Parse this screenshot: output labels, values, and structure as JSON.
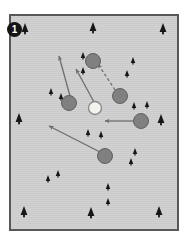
{
  "figure": {
    "panel_label": "1",
    "label_shape": "filled-black-circle",
    "background_color": "#cfcfcf",
    "border_color": "#585858",
    "page_background": "#ffffff",
    "plot": {
      "x": 9,
      "y": 14,
      "width": 170,
      "height": 217
    }
  },
  "legend_colors": {
    "node_fill": "#808080",
    "node_stroke": "#5f5f5f",
    "highlight_node_fill": "#f2f2ee",
    "highlight_node_stroke": "#8a8a8a",
    "path_color": "#6e6e6e",
    "tree_color": "#171717",
    "label_background": "#141414",
    "label_text": "#ffffff"
  },
  "chart_data": {
    "type": "scatter",
    "title": "",
    "subtitle": "",
    "xlabel": "",
    "ylabel": "",
    "grid": false,
    "legend_position": "none",
    "xlim": [
      0,
      166
    ],
    "ylim": [
      0,
      213
    ],
    "annotations": [
      {
        "name": "panel-number",
        "text": "1",
        "x": 15,
        "y": 30
      }
    ],
    "series": [
      {
        "name": "trees",
        "marker": "conifer-tree",
        "points": [
          {
            "x": 14,
            "y": 16,
            "size": 9
          },
          {
            "x": 82,
            "y": 15,
            "size": 9
          },
          {
            "x": 152,
            "y": 16,
            "size": 9
          },
          {
            "x": 72,
            "y": 42,
            "size": 6
          },
          {
            "x": 72,
            "y": 57,
            "size": 6
          },
          {
            "x": 122,
            "y": 47,
            "size": 6
          },
          {
            "x": 116,
            "y": 60,
            "size": 6
          },
          {
            "x": 40,
            "y": 78,
            "size": 6
          },
          {
            "x": 50,
            "y": 83,
            "size": 6
          },
          {
            "x": 123,
            "y": 92,
            "size": 6
          },
          {
            "x": 136,
            "y": 91,
            "size": 6
          },
          {
            "x": 8,
            "y": 106,
            "size": 9
          },
          {
            "x": 150,
            "y": 107,
            "size": 9
          },
          {
            "x": 77,
            "y": 119,
            "size": 6
          },
          {
            "x": 90,
            "y": 121,
            "size": 6
          },
          {
            "x": 124,
            "y": 138,
            "size": 6
          },
          {
            "x": 120,
            "y": 148,
            "size": 6
          },
          {
            "x": 37,
            "y": 165,
            "size": 6
          },
          {
            "x": 47,
            "y": 160,
            "size": 6
          },
          {
            "x": 97,
            "y": 173,
            "size": 6
          },
          {
            "x": 97,
            "y": 188,
            "size": 6
          },
          {
            "x": 13,
            "y": 199,
            "size": 9
          },
          {
            "x": 80,
            "y": 200,
            "size": 9
          },
          {
            "x": 148,
            "y": 199,
            "size": 9
          }
        ]
      },
      {
        "name": "occupied-patches",
        "marker": "filled-circle",
        "points": [
          {
            "x": 82,
            "y": 45,
            "r": 7.5
          },
          {
            "x": 58,
            "y": 87,
            "r": 7.5
          },
          {
            "x": 109,
            "y": 80,
            "r": 7.5
          },
          {
            "x": 130,
            "y": 105,
            "r": 7.5
          },
          {
            "x": 94,
            "y": 140,
            "r": 7.5
          }
        ]
      },
      {
        "name": "source-patch",
        "marker": "open-circle",
        "points": [
          {
            "x": 84,
            "y": 92,
            "r": 6.5
          }
        ]
      }
    ],
    "vectors": [
      {
        "name": "dispersal-1",
        "style": "solid",
        "x1": 59,
        "y1": 80,
        "x2": 48,
        "y2": 40
      },
      {
        "name": "dispersal-2",
        "style": "solid",
        "x1": 83,
        "y1": 86,
        "x2": 65,
        "y2": 53
      },
      {
        "name": "dispersal-3",
        "style": "dashed",
        "x1": 104,
        "y1": 74,
        "x2": 87,
        "y2": 48
      },
      {
        "name": "dispersal-4",
        "style": "solid",
        "x1": 123,
        "y1": 105,
        "x2": 94,
        "y2": 105
      },
      {
        "name": "dispersal-5",
        "style": "solid",
        "x1": 89,
        "y1": 136,
        "x2": 38,
        "y2": 110
      }
    ]
  }
}
